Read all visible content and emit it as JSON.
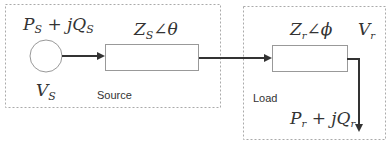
{
  "diagram": {
    "source": {
      "region_label": "Source",
      "power_label": "P_S + jQ_S",
      "power_main1": "P",
      "power_sub1": "S",
      "power_mid": " + jQ",
      "power_sub2": "S",
      "voltage_main": "V",
      "voltage_sub": "S",
      "impedance_main": "Z",
      "impedance_sub": "S",
      "impedance_angle": "∠θ"
    },
    "load": {
      "region_label": "Load",
      "power_main1": "P",
      "power_sub1": "r",
      "power_mid": " + jQ",
      "power_sub2": "r",
      "voltage_main": "V",
      "voltage_sub": "r",
      "impedance_main": "Z",
      "impedance_sub": "r",
      "impedance_angle": "∠ϕ"
    },
    "colors": {
      "line": "#333333",
      "box_border": "#999999",
      "dashed_border": "#aaaaaa"
    }
  }
}
